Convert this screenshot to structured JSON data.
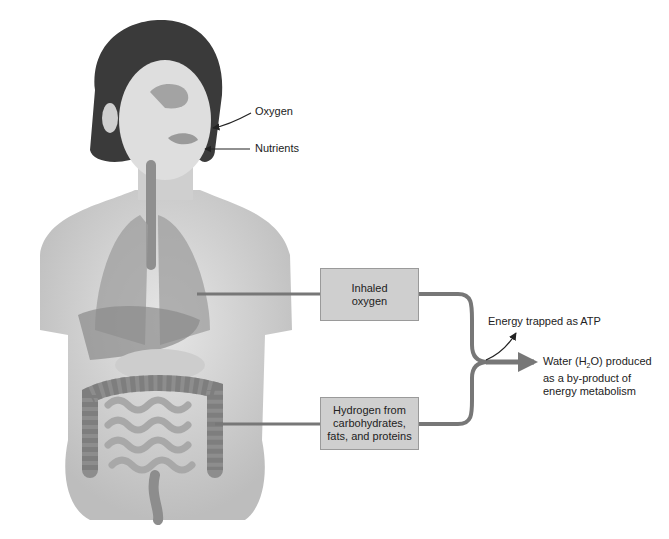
{
  "labels": {
    "oxygen": "Oxygen",
    "nutrients": "Nutrients",
    "atp": "Energy trapped as ATP",
    "water_line1_pre": "Water (H",
    "water_sub": "2",
    "water_line1_post": "O) produced",
    "water_line2": "as a by-product of",
    "water_line3": "energy metabolism"
  },
  "boxes": {
    "inhaled": [
      "Inhaled",
      "oxygen"
    ],
    "hydrogen": [
      "Hydrogen from",
      "carbohydrates,",
      "fats, and proteins"
    ]
  },
  "colors": {
    "connector": "#777777",
    "box_fill": "#cfcfcf",
    "skin": "#d9d9d9",
    "organs": "#9a9a9a"
  }
}
